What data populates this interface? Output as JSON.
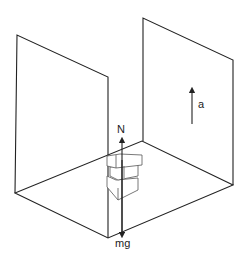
{
  "diagram": {
    "labels": {
      "normal_force": "N",
      "weight": "mg",
      "acceleration": "a"
    },
    "colors": {
      "stroke": "#222222",
      "background": "#ffffff"
    }
  }
}
